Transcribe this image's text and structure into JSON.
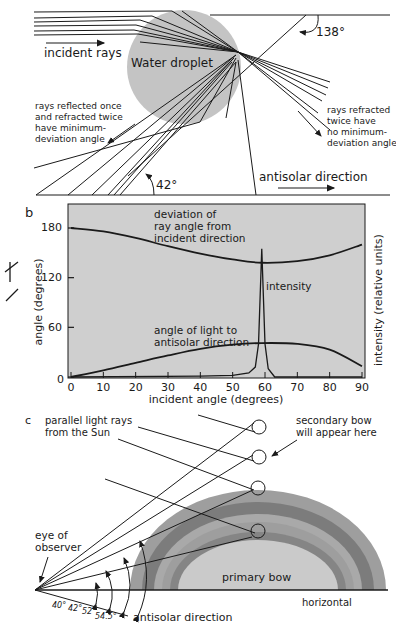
{
  "panel_a": {
    "droplet_label": "Water droplet",
    "incident_label": "incident rays",
    "angle_top": "138°",
    "angle_bottom": "42°",
    "reflected_note": [
      "rays reflected once",
      "and refracted twice",
      "have minimum-",
      "deviation angle"
    ],
    "refracted_note": [
      "rays refracted",
      "twice have",
      "no minimum-",
      "deviation angle"
    ],
    "antisolar_label": "antisolar direction"
  },
  "panel_b": {
    "letter": "b",
    "ylabel": "angle (degrees)",
    "ylabel_right": "intensity (relative units)",
    "xlabel": "incident angle (degrees)",
    "x_ticks": [
      "0",
      "10",
      "20",
      "30",
      "40",
      "50",
      "60",
      "70",
      "80",
      "90"
    ],
    "y_ticks": [
      "0",
      "60",
      "120",
      "180"
    ],
    "deviation_label": [
      "deviation of",
      "ray angle from",
      "incident direction"
    ],
    "intensity_label": "intensity",
    "antisolar_label": [
      "angle of light to",
      "antisolar direction"
    ]
  },
  "panel_c": {
    "letter": "c",
    "sun_label": [
      "parallel light rays",
      "from the Sun"
    ],
    "secondary_label": [
      "secondary bow",
      "will appear here"
    ],
    "eye_label": [
      "eye of",
      "observer"
    ],
    "primary_label": "primary bow",
    "horizontal_label": "horizontal",
    "antisolar_label": "antisolar direction",
    "angles": [
      "40°",
      "42°",
      "52°",
      "54.5°"
    ]
  },
  "colors": {
    "droplet": "#c4c4c4",
    "chart_bg": "#cfcfcf",
    "bow_outer": "#9e9e9e",
    "bow_dark": "#7c7c7c",
    "bow_mid": "#a9a9a9",
    "bow_inner_dark": "#858585",
    "bow_fill": "#cacaca",
    "ink": "#1a1a1a"
  },
  "chart_data": {
    "type": "line",
    "title": "",
    "xlabel": "incident angle (degrees)",
    "ylabel": "angle (degrees)",
    "ylabel_right": "intensity (relative units)",
    "xlim": [
      0,
      90
    ],
    "ylim": [
      0,
      180
    ],
    "x_ticks": [
      0,
      10,
      20,
      30,
      40,
      50,
      60,
      70,
      80,
      90
    ],
    "y_ticks": [
      0,
      60,
      120,
      180
    ],
    "grid": false,
    "x": [
      0,
      10,
      20,
      30,
      40,
      50,
      59,
      70,
      80,
      90
    ],
    "series": [
      {
        "name": "deviation of ray angle from incident direction",
        "values": [
          180,
          176,
          168,
          158,
          149,
          142,
          138,
          140,
          147,
          160
        ]
      },
      {
        "name": "angle of light to antisolar direction",
        "values": [
          0,
          8,
          17,
          26,
          34,
          39,
          41,
          40,
          33,
          13
        ]
      },
      {
        "name": "intensity",
        "x": [
          0,
          40,
          50,
          55,
          57,
          58,
          59,
          60,
          61,
          63,
          90
        ],
        "values": [
          0,
          1,
          2,
          5,
          12,
          40,
          155,
          40,
          10,
          0,
          0
        ]
      }
    ]
  }
}
